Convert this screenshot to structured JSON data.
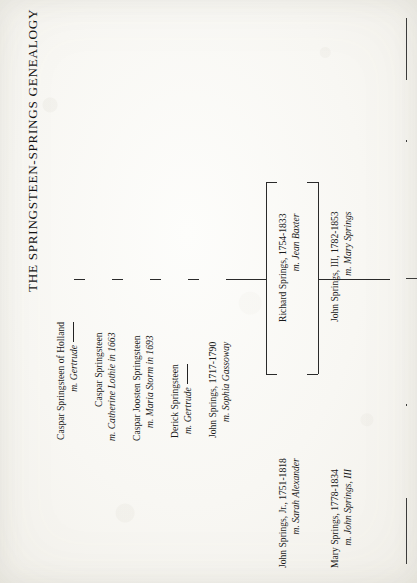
{
  "document": {
    "title": "THE SPRINGSTEEN-SPRINGS GENEALOGY",
    "orientation": "rotated-90-ccw",
    "ink_color": "#191919",
    "paper_color": "#f7f6f2"
  },
  "generations": [
    {
      "id": "gen1",
      "person": "Caspar Springsteen of Holland",
      "spouse": "m. Gertrude",
      "spouse_has_trailing_rule": true
    },
    {
      "id": "gen2",
      "person": "Caspar Springsteen",
      "spouse": "m. Catherine Lothie in 1663",
      "spouse_has_trailing_rule": false
    },
    {
      "id": "gen3",
      "person": "Caspar Joosten Springsteen",
      "spouse": "m. Maria Storm in 1693",
      "spouse_has_trailing_rule": false
    },
    {
      "id": "gen4",
      "person": "Derick Springsteen",
      "spouse": "m. Gertrude",
      "spouse_has_trailing_rule": true
    },
    {
      "id": "gen5",
      "person": "John Springs, 1717-1790",
      "spouse": "m. Sophia Gassoway",
      "spouse_has_trailing_rule": false
    }
  ],
  "children": [
    {
      "id": "child-richard",
      "person": "Richard Springs, 1754-1833",
      "spouse": "m. Jean Baxter",
      "branch": "upper"
    },
    {
      "id": "child-john-jr",
      "person": "John Springs, Jr., 1751-1818",
      "spouse": "m. Sarah Alexander",
      "branch": "lower"
    }
  ],
  "grandchildren": [
    {
      "id": "gc-john-iii",
      "person": "John Springs, III, 1782-1853",
      "spouse": "m. Mary Springs",
      "branch": "upper"
    },
    {
      "id": "gc-mary",
      "person": "Mary Springs, 1778-1834",
      "spouse": "m. John Springs, III",
      "branch": "lower"
    }
  ]
}
